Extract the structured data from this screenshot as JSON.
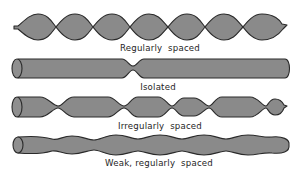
{
  "figure": {
    "type": "schematic",
    "fill_color": "#8a8a8a",
    "stroke_color": "#2a2a2a",
    "background": "#ffffff"
  },
  "rows": [
    {
      "id": "regular",
      "label": "Regularly  spaced",
      "description": "Seven evenly spaced beads with deep constrictions between them"
    },
    {
      "id": "isolated",
      "label": "Isolated",
      "description": "Uniform cylinder with a single isolated neck"
    },
    {
      "id": "irregular",
      "label": "Irregularly  spaced",
      "description": "Segments of varying length separated by necks at irregular intervals"
    },
    {
      "id": "weak",
      "label": "Weak, regularly  spaced",
      "description": "Cylinder with shallow, evenly spaced undulations"
    }
  ]
}
